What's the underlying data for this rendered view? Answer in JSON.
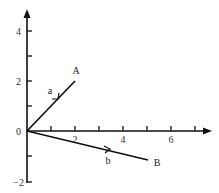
{
  "diagram": {
    "type": "vector-plot",
    "axes": {
      "x_ticks": [
        "2",
        "4",
        "6"
      ],
      "y_ticks": [
        "4",
        "2",
        "0",
        "−2"
      ]
    },
    "points": {
      "A": {
        "label": "A",
        "x": 2,
        "y": 2
      },
      "B": {
        "label": "B",
        "x": 5,
        "y": -1
      }
    },
    "vectors": {
      "a": {
        "label": "a",
        "from": "0",
        "to": "A"
      },
      "b": {
        "label": "b",
        "from": "0",
        "to": "B"
      }
    }
  }
}
